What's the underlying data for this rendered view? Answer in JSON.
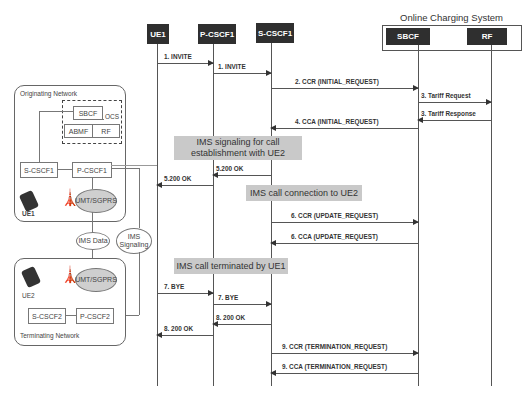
{
  "ocs": {
    "title": "Online Charging System"
  },
  "entities": [
    {
      "id": "ue1",
      "label": "UE1"
    },
    {
      "id": "pcscf1",
      "label": "P-CSCF1"
    },
    {
      "id": "scscf1",
      "label": "S-CSCF1"
    },
    {
      "id": "sbcf",
      "label": "SBCF"
    },
    {
      "id": "rf",
      "label": "RF"
    }
  ],
  "messages": [
    {
      "label": "1. INVITE",
      "from": "UE1",
      "to": "P-CSCF1"
    },
    {
      "label": "1. INVITE",
      "from": "P-CSCF1",
      "to": "S-CSCF1"
    },
    {
      "label": "2. CCR (INITIAL_REQUEST)",
      "from": "S-CSCF1",
      "to": "SBCF"
    },
    {
      "label": "3. Tariff Request",
      "from": "SBCF",
      "to": "RF"
    },
    {
      "label": "3. Tariff Response",
      "from": "RF",
      "to": "SBCF"
    },
    {
      "label": "4. CCA (INITIAL_REQUEST)",
      "from": "SBCF",
      "to": "S-CSCF1"
    },
    {
      "label": "5.200 OK",
      "from": "S-CSCF1",
      "to": "P-CSCF1"
    },
    {
      "label": "5.200 OK",
      "from": "P-CSCF1",
      "to": "UE1"
    },
    {
      "label": "6. CCR (UPDATE_REQUEST)",
      "from": "S-CSCF1",
      "to": "SBCF"
    },
    {
      "label": "6. CCA (UPDATE_REQUEST)",
      "from": "SBCF",
      "to": "S-CSCF1"
    },
    {
      "label": "7. BYE",
      "from": "UE1",
      "to": "P-CSCF1"
    },
    {
      "label": "7. BYE",
      "from": "P-CSCF1",
      "to": "S-CSCF1"
    },
    {
      "label": "8. 200 OK",
      "from": "S-CSCF1",
      "to": "P-CSCF1"
    },
    {
      "label": "8. 200 OK",
      "from": "P-CSCF1",
      "to": "UE1"
    },
    {
      "label": "9. CCR (TERMINATION_REQUEST)",
      "from": "S-CSCF1",
      "to": "SBCF"
    },
    {
      "label": "9. CCA (TERMINATION_REQUEST)",
      "from": "SBCF",
      "to": "S-CSCF1"
    }
  ],
  "notes": [
    {
      "text": "IMS signaling for call establishment with UE2"
    },
    {
      "text": "IMS call connection to UE2"
    },
    {
      "text": "IMS call terminated by UE1"
    }
  ],
  "network": {
    "originating": {
      "label": "Originating Network",
      "ocs_label": "OCS",
      "sbcf": "SBCF",
      "abmf": "ABMF",
      "rf": "RF",
      "scscf": "S-CSCF1",
      "pcscf": "P-CSCF1",
      "radio": "UMT/SGPRS",
      "ue": "UE1"
    },
    "ims_data": "IMS Data",
    "ims_signaling": "IMS Signaling",
    "terminating": {
      "label": "Terminating Network",
      "scscf": "S-CSCF2",
      "pcscf": "P-CSCF2",
      "radio": "UMT/SGPRS",
      "ue": "UE2"
    }
  }
}
